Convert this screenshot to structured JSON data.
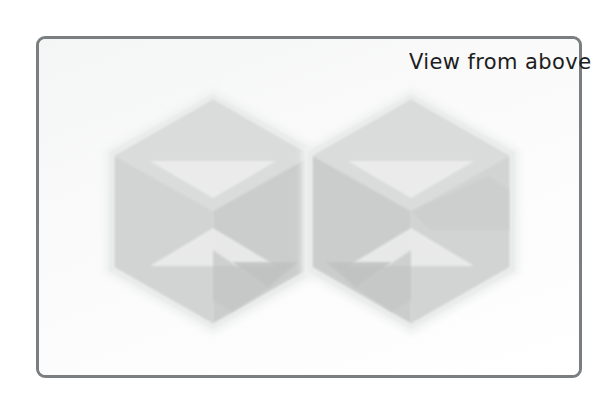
{
  "canvas": {
    "width": 613,
    "height": 399,
    "background": "#ffffff"
  },
  "frame": {
    "name": "hand-drawn-panel-border",
    "stroke_color": "#7b7e80",
    "stroke_width": 3.5,
    "corner_radius": 9,
    "fill": "#fbfbfb",
    "x": 36,
    "y": 36,
    "width": 546,
    "height": 342
  },
  "caption": {
    "text": "View from above",
    "color": "#1d1d1d",
    "font_size": 21,
    "x": 409,
    "y": 50,
    "align": "right"
  },
  "illustration": {
    "description": "Two mirrored isometric cubes seen from above, drawn as overlapping hexagon silhouettes with soft grey internal face shading",
    "halo_color": "#f0f1f1",
    "outline_color": "#e4e6e6",
    "face_top_color": "#d6d8d8",
    "face_left_color": "#cfd1d1",
    "face_right_color": "#c6c8c8",
    "face_inner_color": "#bfc1c1",
    "shapes": [
      {
        "name": "cube-left",
        "center_x": 213,
        "center_y": 211,
        "radius": 116,
        "mirrored": false,
        "vertices": [
          [
            213,
            96
          ],
          [
            313,
            154
          ],
          [
            313,
            268
          ],
          [
            213,
            326
          ],
          [
            112,
            268
          ],
          [
            112,
            154
          ]
        ],
        "interior_vertex": [
          213,
          211
        ]
      },
      {
        "name": "cube-right",
        "center_x": 411,
        "center_y": 211,
        "radius": 116,
        "mirrored": true,
        "vertices": [
          [
            411,
            96
          ],
          [
            511,
            154
          ],
          [
            511,
            268
          ],
          [
            411,
            326
          ],
          [
            311,
            268
          ],
          [
            311,
            154
          ]
        ],
        "interior_vertex": [
          411,
          211
        ]
      }
    ]
  }
}
